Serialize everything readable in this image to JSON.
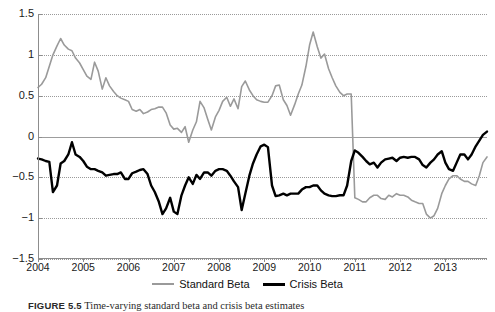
{
  "chart_data": {
    "type": "line",
    "title": "",
    "subtitle": "",
    "xlabel": "",
    "ylabel": "",
    "xlim": [
      2004.0,
      2013.92
    ],
    "ylim": [
      -1.5,
      1.5
    ],
    "yticks": [
      1.5,
      1,
      0.5,
      0,
      -0.5,
      -1,
      -1.5
    ],
    "ytick_labels": [
      "1.5",
      "1",
      "0.5",
      "0",
      "−0.5",
      "−1",
      "−1.5"
    ],
    "xticks": [
      2004,
      2005,
      2006,
      2007,
      2008,
      2009,
      2010,
      2011,
      2012,
      2013
    ],
    "xtick_labels": [
      "2004",
      "2005",
      "2006",
      "2007",
      "2008",
      "2009",
      "2010",
      "2011",
      "2012",
      "2013"
    ],
    "grid": "horizontal-dotted",
    "zero_line": true,
    "legend_position": "below-axis-center",
    "colors": {
      "standard_beta": "#9a9a9a",
      "crisis_beta": "#000000",
      "gridline": "#9a9a9a",
      "axis": "#8d8d8d",
      "background": "#ffffff"
    },
    "series": [
      {
        "name": "Standard Beta",
        "color": "#9a9a9a",
        "width": 1.6,
        "x": [
          2004.0,
          2004.08,
          2004.17,
          2004.25,
          2004.33,
          2004.42,
          2004.5,
          2004.58,
          2004.67,
          2004.75,
          2004.83,
          2004.92,
          2005.0,
          2005.08,
          2005.17,
          2005.25,
          2005.33,
          2005.42,
          2005.5,
          2005.58,
          2005.67,
          2005.75,
          2005.83,
          2005.92,
          2006.0,
          2006.08,
          2006.17,
          2006.25,
          2006.33,
          2006.42,
          2006.5,
          2006.58,
          2006.67,
          2006.75,
          2006.83,
          2006.92,
          2007.0,
          2007.08,
          2007.17,
          2007.25,
          2007.33,
          2007.42,
          2007.5,
          2007.58,
          2007.67,
          2007.75,
          2007.83,
          2007.92,
          2008.0,
          2008.08,
          2008.17,
          2008.25,
          2008.33,
          2008.42,
          2008.5,
          2008.58,
          2008.67,
          2008.75,
          2008.83,
          2008.92,
          2009.0,
          2009.08,
          2009.17,
          2009.25,
          2009.33,
          2009.42,
          2009.5,
          2009.58,
          2009.67,
          2009.75,
          2009.83,
          2009.92,
          2010.0,
          2010.08,
          2010.17,
          2010.25,
          2010.33,
          2010.42,
          2010.5,
          2010.58,
          2010.67,
          2010.75,
          2010.83,
          2010.92,
          2011.0,
          2011.08,
          2011.17,
          2011.25,
          2011.33,
          2011.42,
          2011.5,
          2011.58,
          2011.67,
          2011.75,
          2011.83,
          2011.92,
          2012.0,
          2012.08,
          2012.17,
          2012.25,
          2012.33,
          2012.42,
          2012.5,
          2012.58,
          2012.67,
          2012.75,
          2012.83,
          2012.92,
          2013.0,
          2013.08,
          2013.17,
          2013.25,
          2013.33,
          2013.42,
          2013.5,
          2013.58,
          2013.67,
          2013.75,
          2013.83,
          2013.92
        ],
        "y": [
          0.6,
          0.64,
          0.72,
          0.86,
          1.0,
          1.11,
          1.2,
          1.12,
          1.07,
          1.05,
          0.96,
          0.9,
          0.82,
          0.74,
          0.7,
          0.91,
          0.8,
          0.58,
          0.72,
          0.62,
          0.55,
          0.5,
          0.47,
          0.45,
          0.43,
          0.33,
          0.31,
          0.33,
          0.28,
          0.3,
          0.33,
          0.34,
          0.36,
          0.36,
          0.29,
          0.14,
          0.09,
          0.1,
          0.05,
          0.12,
          -0.07,
          0.08,
          0.18,
          0.43,
          0.35,
          0.21,
          0.08,
          0.24,
          0.32,
          0.43,
          0.48,
          0.37,
          0.46,
          0.34,
          0.61,
          0.68,
          0.57,
          0.5,
          0.45,
          0.43,
          0.42,
          0.42,
          0.5,
          0.62,
          0.63,
          0.45,
          0.38,
          0.26,
          0.39,
          0.52,
          0.63,
          0.86,
          1.12,
          1.28,
          1.1,
          0.96,
          1.01,
          0.83,
          0.72,
          0.62,
          0.54,
          0.5,
          0.52,
          0.52,
          -0.75,
          -0.77,
          -0.8,
          -0.8,
          -0.75,
          -0.72,
          -0.72,
          -0.76,
          -0.77,
          -0.72,
          -0.74,
          -0.7,
          -0.72,
          -0.72,
          -0.74,
          -0.78,
          -0.8,
          -0.82,
          -0.82,
          -0.95,
          -1.0,
          -0.97,
          -0.88,
          -0.7,
          -0.6,
          -0.52,
          -0.48,
          -0.48,
          -0.52,
          -0.55,
          -0.55,
          -0.58,
          -0.6,
          -0.48,
          -0.32,
          -0.25
        ]
      },
      {
        "name": "Crisis Beta",
        "color": "#000000",
        "width": 2.4,
        "x": [
          2004.0,
          2004.08,
          2004.17,
          2004.25,
          2004.33,
          2004.42,
          2004.5,
          2004.58,
          2004.67,
          2004.75,
          2004.83,
          2004.92,
          2005.0,
          2005.08,
          2005.17,
          2005.25,
          2005.33,
          2005.42,
          2005.5,
          2005.58,
          2005.67,
          2005.75,
          2005.83,
          2005.92,
          2006.0,
          2006.08,
          2006.17,
          2006.25,
          2006.33,
          2006.42,
          2006.5,
          2006.58,
          2006.67,
          2006.75,
          2006.83,
          2006.92,
          2007.0,
          2007.08,
          2007.17,
          2007.25,
          2007.33,
          2007.42,
          2007.5,
          2007.58,
          2007.67,
          2007.75,
          2007.83,
          2007.92,
          2008.0,
          2008.08,
          2008.17,
          2008.25,
          2008.33,
          2008.42,
          2008.5,
          2008.58,
          2008.67,
          2008.75,
          2008.83,
          2008.92,
          2009.0,
          2009.08,
          2009.17,
          2009.25,
          2009.33,
          2009.42,
          2009.5,
          2009.58,
          2009.67,
          2009.75,
          2009.83,
          2009.92,
          2010.0,
          2010.08,
          2010.17,
          2010.25,
          2010.33,
          2010.42,
          2010.5,
          2010.58,
          2010.67,
          2010.75,
          2010.83,
          2010.92,
          2011.0,
          2011.08,
          2011.17,
          2011.25,
          2011.33,
          2011.42,
          2011.5,
          2011.58,
          2011.67,
          2011.75,
          2011.83,
          2011.92,
          2012.0,
          2012.08,
          2012.17,
          2012.25,
          2012.33,
          2012.42,
          2012.5,
          2012.58,
          2012.67,
          2012.75,
          2012.83,
          2012.92,
          2013.0,
          2013.08,
          2013.17,
          2013.25,
          2013.33,
          2013.42,
          2013.5,
          2013.58,
          2013.67,
          2013.75,
          2013.83,
          2013.92
        ],
        "y": [
          -0.27,
          -0.28,
          -0.3,
          -0.31,
          -0.68,
          -0.6,
          -0.33,
          -0.3,
          -0.22,
          -0.07,
          -0.22,
          -0.25,
          -0.3,
          -0.37,
          -0.4,
          -0.4,
          -0.42,
          -0.44,
          -0.48,
          -0.47,
          -0.46,
          -0.46,
          -0.44,
          -0.52,
          -0.52,
          -0.45,
          -0.43,
          -0.41,
          -0.4,
          -0.46,
          -0.6,
          -0.68,
          -0.8,
          -0.95,
          -0.88,
          -0.75,
          -0.92,
          -0.95,
          -0.72,
          -0.6,
          -0.5,
          -0.58,
          -0.47,
          -0.52,
          -0.44,
          -0.44,
          -0.48,
          -0.42,
          -0.4,
          -0.4,
          -0.42,
          -0.48,
          -0.55,
          -0.62,
          -0.9,
          -0.7,
          -0.48,
          -0.33,
          -0.22,
          -0.12,
          -0.1,
          -0.13,
          -0.6,
          -0.73,
          -0.72,
          -0.7,
          -0.72,
          -0.7,
          -0.7,
          -0.7,
          -0.65,
          -0.62,
          -0.62,
          -0.6,
          -0.6,
          -0.66,
          -0.7,
          -0.72,
          -0.73,
          -0.73,
          -0.72,
          -0.72,
          -0.6,
          -0.3,
          -0.17,
          -0.2,
          -0.25,
          -0.3,
          -0.34,
          -0.32,
          -0.38,
          -0.32,
          -0.28,
          -0.27,
          -0.26,
          -0.3,
          -0.26,
          -0.25,
          -0.26,
          -0.25,
          -0.25,
          -0.28,
          -0.35,
          -0.38,
          -0.32,
          -0.28,
          -0.22,
          -0.18,
          -0.32,
          -0.4,
          -0.42,
          -0.32,
          -0.22,
          -0.22,
          -0.28,
          -0.22,
          -0.12,
          -0.05,
          0.02,
          0.06
        ]
      }
    ],
    "legend": [
      {
        "label": "Standard Beta",
        "color": "#9a9a9a",
        "style": "thin-gray-line"
      },
      {
        "label": "Crisis Beta",
        "color": "#000000",
        "style": "thick-black-line"
      }
    ]
  },
  "caption": {
    "label": "FIGURE 5.5",
    "text": "Time-varying standard beta and crisis beta estimates"
  }
}
